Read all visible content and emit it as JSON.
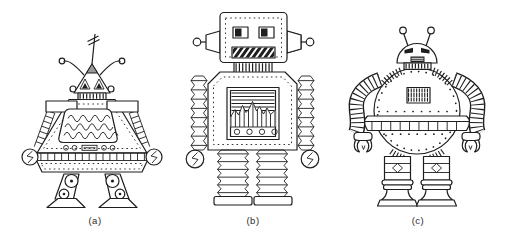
{
  "figure": {
    "background_color": "#ffffff",
    "ink_color": "#1f1f1f",
    "robots": [
      {
        "label": "(a)",
        "icon": "pyramid-robot-illustration"
      },
      {
        "label": "(b)",
        "icon": "box-robot-illustration"
      },
      {
        "label": "(c)",
        "icon": "round-robot-illustration"
      }
    ]
  }
}
